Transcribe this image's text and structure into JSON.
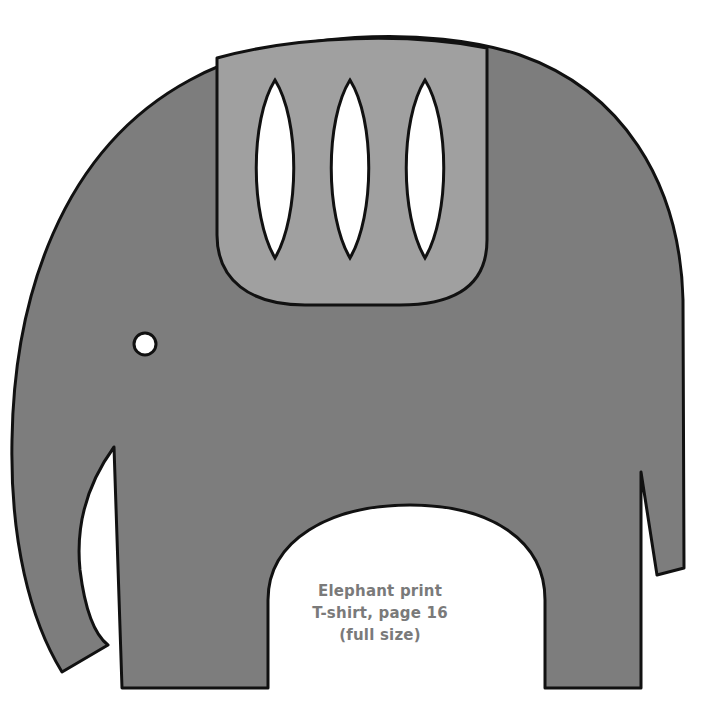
{
  "figure": {
    "colors": {
      "body": "#7d7d7d",
      "saddle": "#a0a0a0",
      "outline": "#111111",
      "cutout": "#ffffff",
      "caption": "#7a7a7a"
    },
    "caption": {
      "line1": "Elephant print",
      "line2": "T-shirt, page 16",
      "line3": "(full size)"
    }
  }
}
